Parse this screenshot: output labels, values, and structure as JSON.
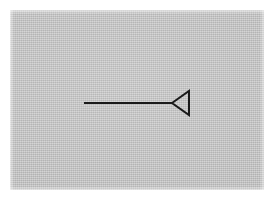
{
  "document": {
    "type": "scanned-line-drawing",
    "title": "Leftward hollow arrow"
  },
  "canvas": {
    "width": 274,
    "height": 201,
    "page_background_color": "#ffffff"
  },
  "plate": {
    "name": "scanned-gray-plate",
    "x": 10,
    "y": 10,
    "width": 254,
    "height": 180,
    "fill_color": "#c3c3c3",
    "texture": "halftone-dither-grain"
  },
  "figure": {
    "name": "arrow-pointing-left",
    "stroke_color": "#1a1a1a",
    "stroke_width": 2,
    "fill": "none",
    "shaft": {
      "name": "arrow-shaft",
      "x1": 84,
      "y1": 103,
      "x2": 173,
      "y2": 103
    },
    "arrowhead": {
      "name": "arrowhead-triangle-left",
      "style": "hollow-outline",
      "apex_x": 172,
      "apex_y": 103,
      "base_x": 189,
      "base_top_y": 91,
      "base_bottom_y": 115,
      "points": "172,103 189,91 189,115 172,103"
    }
  }
}
